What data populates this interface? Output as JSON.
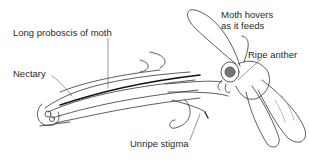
{
  "figure": {
    "labels": {
      "proboscis": "Long proboscis of moth",
      "nectary": "Nectary",
      "hovers_line1": "Moth hovers",
      "hovers_line2": "as it feeds",
      "anther": "Ripe anther",
      "stigma": "Unripe stigma"
    }
  }
}
